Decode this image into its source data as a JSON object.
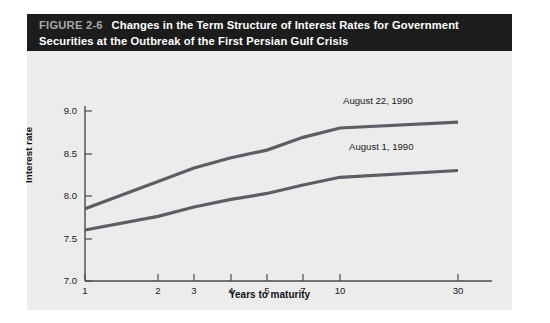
{
  "figure": {
    "number": "FIGURE 2-6",
    "title": "Changes in the Term Structure of Interest Rates for Government Securities at the Outbreak of the First Persian Gulf Crisis",
    "header_bg": "#1c1c1c",
    "number_color": "#a9a9a9",
    "title_color": "#ffffff",
    "panel_bg": "#ececec"
  },
  "chart_data": {
    "type": "line",
    "title": "Changes in the Term Structure of Interest Rates for Government Securities at the Outbreak of the First Persian Gulf Crisis",
    "xlabel": "Years to maturity",
    "ylabel": "Interest rate",
    "x": [
      1,
      2,
      3,
      4,
      5,
      7,
      10,
      30
    ],
    "x_tick_labels": [
      "1",
      "2",
      "3",
      "4",
      "5",
      "7",
      "10",
      "30"
    ],
    "y_ticks": [
      7.0,
      7.5,
      8.0,
      8.5,
      9.0
    ],
    "y_tick_labels": [
      "7.0",
      "7.5",
      "8.0",
      "8.5",
      "9.0"
    ],
    "ylim": [
      7.0,
      9.05
    ],
    "grid": false,
    "legend_position": "inline-labels",
    "axis_scale_x": "ordinal-nonlinear",
    "series": [
      {
        "name": "August 22, 1990",
        "color": "#5d5d66",
        "values": [
          7.85,
          8.17,
          8.33,
          8.45,
          8.54,
          8.69,
          8.8,
          8.87
        ]
      },
      {
        "name": "August 1, 1990",
        "color": "#5d5d66",
        "values": [
          7.6,
          7.76,
          7.87,
          7.96,
          8.03,
          8.13,
          8.22,
          8.3
        ]
      }
    ],
    "annotations": [
      {
        "text": "August 22, 1990",
        "x": 10,
        "y": 9.0
      },
      {
        "text": "August 1, 1990",
        "x": 10,
        "y": 8.45
      }
    ]
  }
}
